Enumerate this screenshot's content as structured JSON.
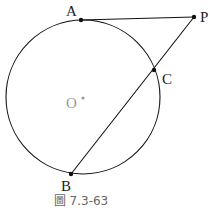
{
  "figure": {
    "caption": "圖 7.3-63",
    "circle": {
      "center_label": "O"
    },
    "points": [
      {
        "name": "A",
        "label": "A"
      },
      {
        "name": "P",
        "label": "P"
      },
      {
        "name": "C",
        "label": "C"
      },
      {
        "name": "B",
        "label": "B"
      }
    ],
    "segments": [
      "AP",
      "PC",
      "CB"
    ],
    "colors": {
      "stroke": "#111111",
      "center": "#999999"
    }
  }
}
